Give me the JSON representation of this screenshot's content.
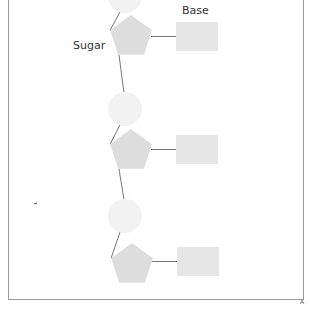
{
  "diagram": {
    "labels": {
      "base": "Base",
      "sugar": "Sugar"
    },
    "colors": {
      "phosphate": "#f2f2f2",
      "sugar": "#dddddd",
      "base": "#e6e6e6",
      "bond": "#555555",
      "border": "#9a9a9a"
    },
    "nucleotides": [
      {
        "phosphate": {
          "cx": 125,
          "cy": -4,
          "r": 17
        },
        "sugar": {
          "cx": 131,
          "cy": 37
        },
        "base": {
          "x": 176,
          "y": 22,
          "w": 42,
          "h": 29
        }
      },
      {
        "phosphate": {
          "cx": 125,
          "cy": 109,
          "r": 17
        },
        "sugar": {
          "cx": 131,
          "cy": 151
        },
        "base": {
          "x": 176,
          "y": 135,
          "w": 42,
          "h": 29
        }
      },
      {
        "phosphate": {
          "cx": 125,
          "cy": 216,
          "r": 17
        },
        "sugar": {
          "cx": 132,
          "cy": 265
        },
        "base": {
          "x": 177,
          "y": 247,
          "w": 42,
          "h": 29
        }
      }
    ],
    "corner_mark": "A"
  }
}
